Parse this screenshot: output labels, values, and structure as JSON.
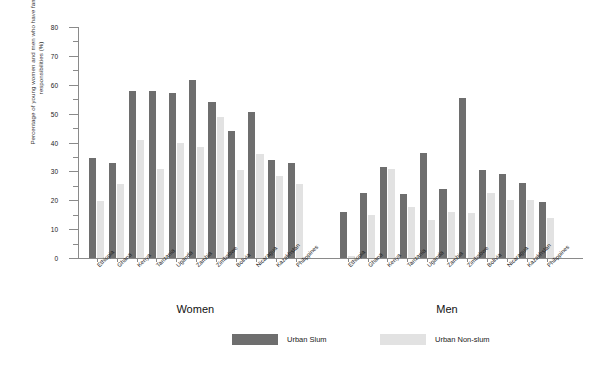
{
  "chart_data": {
    "type": "bar",
    "title": "",
    "xlabel": "",
    "ylabel": "Percentage of young women and men who have family responsibilities (%)",
    "ylim": [
      0,
      80
    ],
    "yticks": [
      0,
      10,
      20,
      30,
      40,
      50,
      60,
      70,
      80
    ],
    "grid": false,
    "legend_position": "bottom-center",
    "groups": [
      "Women",
      "Men"
    ],
    "categories": [
      "Ethiopia",
      "Ghana",
      "Kenya",
      "Tanzania",
      "Uganda",
      "Zambia",
      "Zimbabwe",
      "Bolivia",
      "Nicaragua",
      "Kazakhstan",
      "Philippines"
    ],
    "series": [
      {
        "name": "Urban Slum",
        "color": "#6e6e6e",
        "group_values": {
          "Women": [
            34.5,
            33.0,
            58.0,
            58.0,
            57.0,
            61.5,
            54.0,
            44.0,
            50.5,
            34.0,
            33.0
          ],
          "Men": [
            15.8,
            22.5,
            31.5,
            22.0,
            36.5,
            24.0,
            55.5,
            30.5,
            29.0,
            26.0,
            19.5
          ]
        }
      },
      {
        "name": "Urban Non-slum",
        "color": "#e2e2e2",
        "group_values": {
          "Women": [
            19.8,
            25.8,
            41.0,
            31.0,
            40.0,
            38.5,
            49.0,
            30.5,
            36.0,
            28.5,
            25.5
          ],
          "Men": [
            0.8,
            15.0,
            31.0,
            17.5,
            13.0,
            16.0,
            15.5,
            22.5,
            20.0,
            20.0,
            14.0
          ]
        }
      }
    ]
  },
  "axis": {
    "y_title": "Percentage of young women and men who have family responsibilities (%)",
    "tick_labels": [
      "0",
      "10",
      "20",
      "30",
      "40",
      "50",
      "60",
      "70",
      "80"
    ]
  },
  "group_labels": {
    "women": "Women",
    "men": "Men"
  },
  "legend": {
    "items": [
      {
        "label": "Urban Slum",
        "color": "#6e6e6e"
      },
      {
        "label": "Urban Non-slum",
        "color": "#e2e2e2"
      }
    ]
  }
}
